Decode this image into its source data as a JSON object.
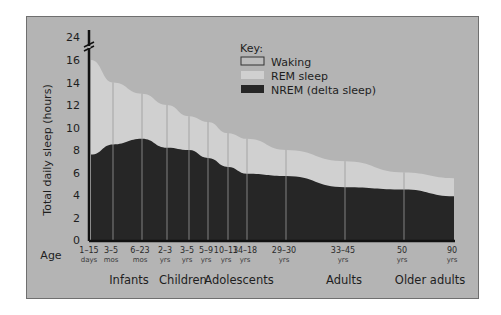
{
  "chart_data": {
    "type": "area",
    "title": "",
    "ylabel": "Total daily sleep (hours)",
    "xlabel": "Age",
    "ylim": [
      0,
      24
    ],
    "y_ticks": [
      "0",
      "2",
      "4",
      "6",
      "8",
      "10",
      "12",
      "14",
      "16",
      "24"
    ],
    "y_axis_break": "between 16 and 24",
    "grid": false,
    "legend_title": "Key:",
    "legend": [
      "Waking",
      "REM sleep",
      "NREM (delta sleep)"
    ],
    "legend_position": "top-center",
    "categories": [
      {
        "top": "1–15",
        "bottom": "days"
      },
      {
        "top": "3–5",
        "bottom": "mos"
      },
      {
        "top": "6–23",
        "bottom": "mos"
      },
      {
        "top": "2–3",
        "bottom": "yrs"
      },
      {
        "top": "3–5",
        "bottom": "yrs"
      },
      {
        "top": "5–9",
        "bottom": "yrs"
      },
      {
        "top": "10–13",
        "bottom": "yrs"
      },
      {
        "top": "14–18",
        "bottom": "yrs"
      },
      {
        "top": "29–30",
        "bottom": "yrs"
      },
      {
        "top": "33–45",
        "bottom": "yrs"
      },
      {
        "top": "50",
        "bottom": "yrs"
      },
      {
        "top": "90",
        "bottom": "yrs"
      }
    ],
    "age_groups": [
      "Infants",
      "Children",
      "Adolescents",
      "Adults",
      "Older adults"
    ],
    "series": [
      {
        "name": "Total sleep (REM + NREM)",
        "values": [
          16,
          14,
          13,
          12,
          11,
          10.5,
          9.5,
          9,
          8,
          7,
          6,
          5.5
        ]
      },
      {
        "name": "NREM (delta sleep)",
        "values": [
          7.6,
          8.5,
          9,
          8.2,
          8,
          7.3,
          6.5,
          5.9,
          5.7,
          4.7,
          4.5,
          3.9
        ]
      }
    ],
    "colors": {
      "waking": "#b4b4b4",
      "rem": "#d0d0d0",
      "nrem": "#262626",
      "panel": "#b4b4b4"
    }
  }
}
